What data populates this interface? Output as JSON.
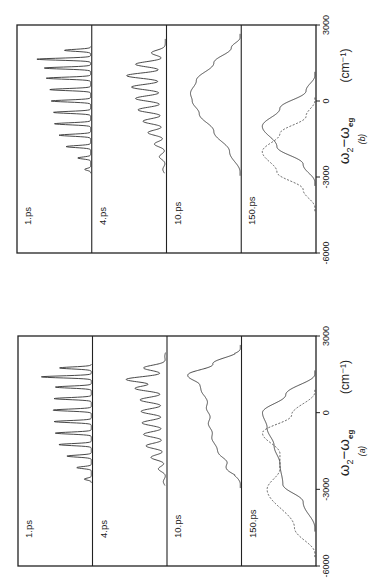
{
  "figure": {
    "orientation": "rotated-90-ccw",
    "background": "#ffffff",
    "line_color": "#333333"
  },
  "chart_data": [
    {
      "type": "line",
      "panel_label": "(a)",
      "xlabel": "ω2−ωeg",
      "xlabel_parts": {
        "main": "ω",
        "sub1": "2",
        "mid": "−ω",
        "sub2": "eg"
      },
      "xunit": "(cm⁻¹)",
      "xlim": [
        -6000,
        3000
      ],
      "xticks": [
        -6000,
        -3000,
        0,
        3000
      ],
      "xtick_labels": [
        "-6000",
        "-3000",
        "0",
        "3000"
      ],
      "grid": false,
      "legend": null,
      "subplots": [
        {
          "label": "1.ps",
          "series": [
            {
              "name": "solid",
              "style": "solid",
              "description": "Regular comb of sharp peaks (~10-11) spanning about -2600 to +1800 cm-1; envelope rises toward higher frequency, tallest peak near +1400",
              "x": [
                -2600,
                -2150,
                -1700,
                -1250,
                -800,
                -350,
                100,
                550,
                1000,
                1400,
                1750
              ],
              "values": [
                0.12,
                0.25,
                0.42,
                0.56,
                0.62,
                0.64,
                0.66,
                0.64,
                0.62,
                0.86,
                0.55
              ]
            }
          ]
        },
        {
          "label": "4.ps",
          "series": [
            {
              "name": "solid",
              "style": "solid",
              "description": "Damped oscillatory progression, ~-2700 to +2200 cm-1, amplitude growing toward higher frequency, max near +1300",
              "x": [
                -2700,
                -2200,
                -1750,
                -1300,
                -850,
                -400,
                50,
                500,
                950,
                1300,
                1750,
                2200
              ],
              "values": [
                0.05,
                0.15,
                0.3,
                0.4,
                0.45,
                0.48,
                0.5,
                0.52,
                0.62,
                0.8,
                0.45,
                0.02
              ]
            }
          ]
        },
        {
          "label": "10.ps",
          "series": [
            {
              "name": "solid",
              "style": "solid",
              "description": "Broad band with small ripples, rising from ~-2800, peak near +1500, sharp falloff to +2500",
              "x": [
                -2800,
                -2000,
                -1200,
                -600,
                0,
                600,
                1100,
                1500,
                1900,
                2500
              ],
              "values": [
                0.0,
                0.25,
                0.45,
                0.52,
                0.55,
                0.6,
                0.72,
                0.9,
                0.45,
                0.0
              ]
            }
          ]
        },
        {
          "label": "150.ps",
          "series": [
            {
              "name": "solid",
              "style": "solid",
              "description": "Two-peaked band: peaks near 0 and -1200 cm-1 with dip near -2000",
              "x": [
                -4500,
                -3500,
                -2800,
                -2000,
                -1300,
                -600,
                0,
                700,
                1500
              ],
              "values": [
                0.0,
                0.2,
                0.55,
                0.6,
                0.7,
                0.82,
                0.9,
                0.5,
                0.0
              ]
            },
            {
              "name": "dashed",
              "style": "dashed",
              "description": "Two-peaked dashed band: peaks near -800 and -3000 cm-1",
              "x": [
                -5500,
                -4500,
                -3000,
                -2200,
                -1600,
                -800,
                -100,
                800
              ],
              "values": [
                0.0,
                0.35,
                0.82,
                0.6,
                0.6,
                0.9,
                0.4,
                0.0
              ]
            }
          ]
        }
      ]
    },
    {
      "type": "line",
      "panel_label": "(b)",
      "xlabel": "ω2−ωeg",
      "xlabel_parts": {
        "main": "ω",
        "sub1": "2",
        "mid": "−ω",
        "sub2": "eg"
      },
      "xunit": "(cm⁻¹)",
      "xlim": [
        -6000,
        3000
      ],
      "xticks": [
        -6000,
        -3000,
        0,
        3000
      ],
      "xtick_labels": [
        "-6000",
        "-3000",
        "0",
        "3000"
      ],
      "grid": false,
      "legend": null,
      "subplots": [
        {
          "label": "1.ps",
          "series": [
            {
              "name": "solid",
              "style": "solid",
              "description": "Sharp comb of ~11 peaks from ~-2700 to +2000 cm-1, tallest near +1600",
              "x": [
                -2700,
                -2250,
                -1800,
                -1350,
                -900,
                -450,
                0,
                450,
                900,
                1300,
                1650,
                2000
              ],
              "values": [
                0.1,
                0.22,
                0.42,
                0.54,
                0.62,
                0.64,
                0.68,
                0.7,
                0.76,
                0.8,
                0.92,
                0.45
              ]
            }
          ]
        },
        {
          "label": "4.ps",
          "series": [
            {
              "name": "solid",
              "style": "solid",
              "description": "Oscillatory progression from ~-2700 to +2300 cm-1, largest near +1000, small shoulder near +2100",
              "x": [
                -2700,
                -2200,
                -1700,
                -1250,
                -800,
                -350,
                100,
                550,
                1000,
                1450,
                1900,
                2300
              ],
              "values": [
                0.05,
                0.12,
                0.22,
                0.35,
                0.45,
                0.55,
                0.6,
                0.68,
                0.78,
                0.6,
                0.28,
                0.0
              ]
            }
          ]
        },
        {
          "label": "10.ps",
          "series": [
            {
              "name": "solid",
              "style": "solid",
              "description": "Single broad asymmetric band, onset ~-2800, max near +300, decays to ~+2500",
              "x": [
                -2800,
                -2000,
                -1200,
                -500,
                0,
                300,
                800,
                1500,
                2100,
                2500
              ],
              "values": [
                0.0,
                0.18,
                0.45,
                0.7,
                0.82,
                0.85,
                0.75,
                0.45,
                0.15,
                0.0
              ]
            }
          ]
        },
        {
          "label": "150.ps",
          "series": [
            {
              "name": "solid",
              "style": "solid",
              "description": "Single Gaussian centered near -1000 cm-1",
              "x": [
                -3200,
                -2500,
                -1800,
                -1000,
                -300,
                400,
                1000
              ],
              "values": [
                0.0,
                0.2,
                0.65,
                0.9,
                0.6,
                0.15,
                0.0
              ]
            },
            {
              "name": "dashed",
              "style": "dashed",
              "description": "Single Gaussian centered near -2000 cm-1",
              "x": [
                -4200,
                -3500,
                -2800,
                -2000,
                -1300,
                -600,
                0
              ],
              "values": [
                0.0,
                0.2,
                0.65,
                0.9,
                0.6,
                0.15,
                0.0
              ]
            }
          ]
        }
      ]
    }
  ]
}
